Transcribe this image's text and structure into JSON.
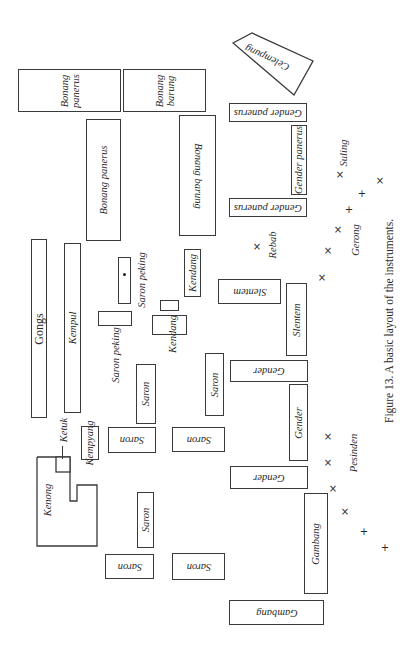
{
  "figure": {
    "caption": "Figure 13.  A basic layout of the instruments."
  },
  "instruments": {
    "bonang_panerus_top": "Bonang panerus",
    "bonang_panerus_top_l1": "Bonang",
    "bonang_panerus_top_l2": "panerus",
    "bonang_barung_top_l1": "Bonang",
    "bonang_barung_top_l2": "barung",
    "bonang_panerus": "Bonang panerus",
    "bonang_barung": "Bonang barung",
    "celempung": "Celempung",
    "gender_panerus_top": "Gender panerus",
    "gender_panerus_mid": "Gender panerus",
    "gender_panerus_bottom": "Gender panerus",
    "gongs": "Gongs",
    "kempul": "Kempul",
    "saron_peking_1": "Saron peking",
    "saron_peking_2": "Saron peking",
    "kendang_1": "Kendang",
    "kendang_2": "Kendang",
    "slentem_1": "Slentem",
    "slentem_2": "Slentem",
    "rebab": "Rebab",
    "gerong": "Gerong",
    "suling": "Suling",
    "saron_1": "Saron",
    "saron_2": "Saron",
    "saron_3": "Saron",
    "saron_4": "Saron",
    "saron_5": "Saron",
    "saron_6": "Saron",
    "saron_7": "Saron",
    "gender_1": "Gender",
    "gender_2": "Gender",
    "gender_3": "Gender",
    "kenong": "Kenong",
    "ketuk": "Ketuk",
    "kempyang": "Kempyang",
    "pesinden": "Pesinden",
    "gambang_1": "Gambang",
    "gambang_2": "Gambang"
  },
  "markers": {
    "cross_x": "×",
    "plus": "+"
  }
}
